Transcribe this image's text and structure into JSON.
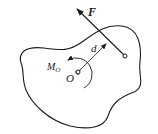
{
  "diagram": {
    "labels": {
      "force": "F",
      "distance": "d",
      "moment": "M",
      "moment_sub": "O",
      "point": "O"
    },
    "colors": {
      "stroke": "#1a1a1a",
      "background": "#ffffff"
    }
  }
}
